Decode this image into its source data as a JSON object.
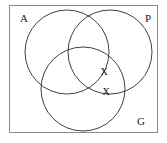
{
  "diagram": {
    "type": "venn-3-set",
    "title": "",
    "universe": {
      "name": "universal-set-rectangle",
      "x": 9,
      "y": 5,
      "width": 149,
      "height": 128,
      "stroke": "#8a8a8a",
      "fill": "#ffffff"
    },
    "stroke_color": "#2b2b2b",
    "background_color": "#ffffff",
    "sets": [
      {
        "id": "A",
        "label": "A",
        "label_x": 20,
        "label_y": 22,
        "cx": 67,
        "cy": 52,
        "r": 42
      },
      {
        "id": "P",
        "label": "P",
        "label_x": 145,
        "label_y": 22,
        "cx": 110,
        "cy": 52,
        "r": 42
      },
      {
        "id": "G",
        "label": "G",
        "label_x": 137,
        "label_y": 125,
        "cx": 83,
        "cy": 89,
        "r": 42
      }
    ],
    "marks": [
      {
        "id": "mark-1",
        "glyph": "X",
        "x": 104,
        "y": 75,
        "region": "A-and-P-and-G"
      },
      {
        "id": "mark-2",
        "glyph": "X",
        "x": 106,
        "y": 95,
        "region": "P-and-G"
      }
    ]
  }
}
